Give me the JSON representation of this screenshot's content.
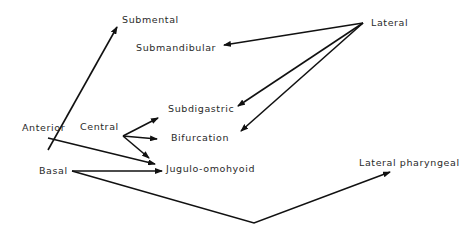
{
  "nodes": {
    "submental": "Submental",
    "submandibular": "Submandibular",
    "lateral": "Lateral",
    "subdigastric": "Subdigastric",
    "bifurcation": "Bifurcation",
    "anterior": "Anterior",
    "central": "Central",
    "jugulo_omohyoid": "Jugulo-omohyoid",
    "basal": "Basal",
    "lateral_pharyngeal": "Lateral pharyngeal"
  },
  "edges": [
    {
      "from": "Anterior",
      "to": "Submental"
    },
    {
      "from": "Anterior",
      "to": "Jugulo-omohyoid"
    },
    {
      "from": "Lateral",
      "to": "Submandibular"
    },
    {
      "from": "Lateral",
      "to": "Subdigastric"
    },
    {
      "from": "Lateral",
      "to": "Bifurcation"
    },
    {
      "from": "Central",
      "to": "Subdigastric"
    },
    {
      "from": "Central",
      "to": "Bifurcation"
    },
    {
      "from": "Central",
      "to": "Jugulo-omohyoid"
    },
    {
      "from": "Basal",
      "to": "Jugulo-omohyoid"
    },
    {
      "from": "Basal",
      "to": "Lateral pharyngeal"
    }
  ],
  "colors": {
    "line": "#111111",
    "text": "#2a2a2a",
    "background": "#ffffff"
  }
}
